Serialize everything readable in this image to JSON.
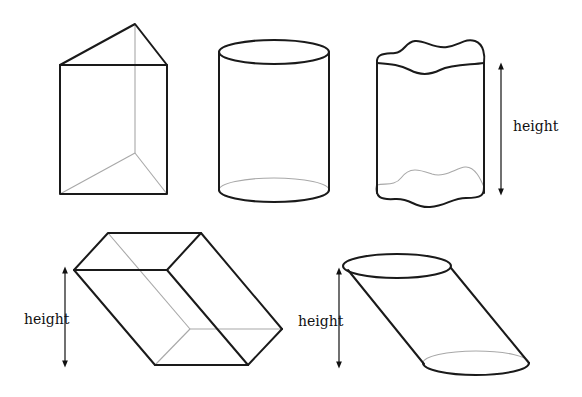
{
  "figure": {
    "shapes": [
      {
        "id": "triangular-prism",
        "label": ""
      },
      {
        "id": "right-cylinder",
        "label": ""
      },
      {
        "id": "irregular-cylinder",
        "label": "height"
      },
      {
        "id": "oblique-prism",
        "label": "height"
      },
      {
        "id": "oblique-cylinder",
        "label": "height"
      }
    ],
    "colors": {
      "edge": "#1a1a1a",
      "hidden_edge": "#a8a8a8",
      "background": "#ffffff"
    }
  }
}
